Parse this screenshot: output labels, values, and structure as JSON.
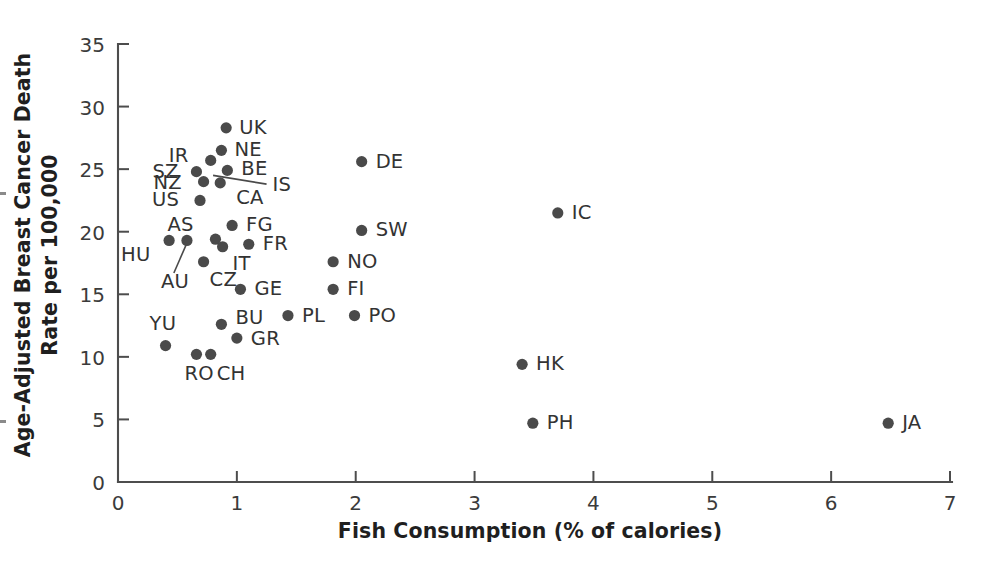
{
  "chart_data": {
    "type": "scatter",
    "title": "",
    "xlabel": "Fish Consumption (% of calories)",
    "ylabel": "Age-Adjusted Breast Cancer Death Rate per 100,000",
    "xlim": [
      0,
      7
    ],
    "ylim": [
      0,
      35
    ],
    "xticks": [
      0,
      1,
      2,
      3,
      4,
      5,
      6,
      7
    ],
    "yticks": [
      0,
      5,
      10,
      15,
      20,
      25,
      30,
      35
    ],
    "xtick_labels": [
      "0",
      "1",
      "2",
      "3",
      "4",
      "5",
      "6",
      "7"
    ],
    "ytick_labels": [
      "0",
      "5",
      "10",
      "15",
      "20",
      "25",
      "30",
      "35"
    ],
    "grid": false,
    "legend": false,
    "marker_color": "#4a4a4a",
    "points": [
      {
        "label": "UK",
        "x": 0.91,
        "y": 28.3,
        "label_dx": 13,
        "label_dy": 6
      },
      {
        "label": "NE",
        "x": 0.87,
        "y": 26.5,
        "label_dx": 13,
        "label_dy": 6
      },
      {
        "label": "IR",
        "x": 0.78,
        "y": 25.7,
        "label_dx": -42,
        "label_dy": 2
      },
      {
        "label": "BE",
        "x": 0.92,
        "y": 24.9,
        "label_dx": 14,
        "label_dy": 5
      },
      {
        "label": "SZ",
        "x": 0.66,
        "y": 24.8,
        "label_dx": -44,
        "label_dy": 6
      },
      {
        "label": "NZ",
        "x": 0.72,
        "y": 24.0,
        "label_dx": -50,
        "label_dy": 7
      },
      {
        "label": "CA",
        "x": 0.86,
        "y": 23.9,
        "label_dx": 16,
        "label_dy": 21
      },
      {
        "label": "US",
        "x": 0.69,
        "y": 22.5,
        "label_dx": -48,
        "label_dy": 6
      },
      {
        "label": "FG",
        "x": 0.96,
        "y": 20.5,
        "label_dx": 14,
        "label_dy": 6
      },
      {
        "label": "AS",
        "x": 0.82,
        "y": 19.4,
        "label_dx": -48,
        "label_dy": -8
      },
      {
        "label": "HU",
        "x": 0.43,
        "y": 19.3,
        "label_dx": -48,
        "label_dy": 21
      },
      {
        "label": "AU",
        "x": 0.58,
        "y": 19.3,
        "label_dx": -26,
        "label_dy": 48
      },
      {
        "label": "FR",
        "x": 1.1,
        "y": 19.0,
        "label_dx": 14,
        "label_dy": 6
      },
      {
        "label": "IT",
        "x": 0.88,
        "y": 18.8,
        "label_dx": 10,
        "label_dy": 23
      },
      {
        "label": "CZ",
        "x": 0.72,
        "y": 17.6,
        "label_dx": 6,
        "label_dy": 24
      },
      {
        "label": "GE",
        "x": 1.03,
        "y": 15.4,
        "label_dx": 14,
        "label_dy": 6
      },
      {
        "label": "BU",
        "x": 0.87,
        "y": 12.6,
        "label_dx": 14,
        "label_dy": 0
      },
      {
        "label": "GR",
        "x": 1.0,
        "y": 11.5,
        "label_dx": 14,
        "label_dy": 7
      },
      {
        "label": "YU",
        "x": 0.4,
        "y": 10.9,
        "label_dx": -16,
        "label_dy": -16
      },
      {
        "label": "RO",
        "x": 0.66,
        "y": 10.2,
        "label_dx": -12,
        "label_dy": 26
      },
      {
        "label": "CH",
        "x": 0.78,
        "y": 10.2,
        "label_dx": 6,
        "label_dy": 26
      },
      {
        "label": "PL",
        "x": 1.43,
        "y": 13.3,
        "label_dx": 14,
        "label_dy": 6
      },
      {
        "label": "FI",
        "x": 1.81,
        "y": 15.4,
        "label_dx": 14,
        "label_dy": 6
      },
      {
        "label": "NO",
        "x": 1.81,
        "y": 17.6,
        "label_dx": 14,
        "label_dy": 6
      },
      {
        "label": "PO",
        "x": 1.99,
        "y": 13.3,
        "label_dx": 14,
        "label_dy": 6
      },
      {
        "label": "SW",
        "x": 2.05,
        "y": 20.1,
        "label_dx": 14,
        "label_dy": 6
      },
      {
        "label": "DE",
        "x": 2.05,
        "y": 25.6,
        "label_dx": 14,
        "label_dy": 6
      },
      {
        "label": "IC",
        "x": 3.7,
        "y": 21.5,
        "label_dx": 14,
        "label_dy": 6
      },
      {
        "label": "HK",
        "x": 3.4,
        "y": 9.4,
        "label_dx": 14,
        "label_dy": 6
      },
      {
        "label": "PH",
        "x": 3.49,
        "y": 4.7,
        "label_dx": 14,
        "label_dy": 6
      },
      {
        "label": "JA",
        "x": 6.48,
        "y": 4.7,
        "label_dx": 14,
        "label_dy": 6
      }
    ],
    "leader_lines": [
      {
        "name": "is-leader",
        "label": "IS",
        "x1": 0.8,
        "y1": 24.5,
        "x2": 1.25,
        "y2": 23.8,
        "label_dx": 6,
        "label_dy": 7
      },
      {
        "name": "au-leader",
        "x1": 0.58,
        "y1": 19.1,
        "x2": 0.47,
        "y2": 16.7
      }
    ]
  }
}
